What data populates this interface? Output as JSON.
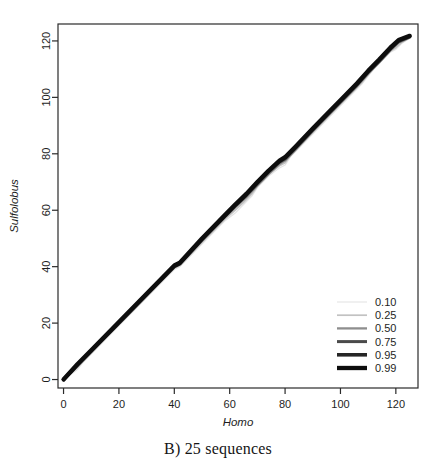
{
  "figure": {
    "caption": "B) 25 sequences",
    "panel_letter": "B)"
  },
  "axes": {
    "x": {
      "title": "Homo",
      "ticks": [
        "0",
        "20",
        "40",
        "60",
        "80",
        "100",
        "120"
      ]
    },
    "y": {
      "title": "Sulfolobus",
      "ticks": [
        "0",
        "20",
        "40",
        "60",
        "80",
        "100",
        "120"
      ]
    }
  },
  "legend": {
    "entries": [
      {
        "label": "0.10",
        "color": "#e3e3e3",
        "width": 1.1
      },
      {
        "label": "0.25",
        "color": "#c2c2c2",
        "width": 1.7
      },
      {
        "label": "0.50",
        "color": "#8e8e8e",
        "width": 2.3
      },
      {
        "label": "0.75",
        "color": "#4a4a4a",
        "width": 3.0
      },
      {
        "label": "0.95",
        "color": "#262626",
        "width": 3.6
      },
      {
        "label": "0.99",
        "color": "#0d0d0d",
        "width": 4.3
      }
    ]
  },
  "chart_data": {
    "type": "line",
    "title": "B) 25 sequences",
    "xlabel": "Homo",
    "ylabel": "Sulfolobus",
    "xlim": [
      -2,
      128
    ],
    "ylim": [
      -3,
      126
    ],
    "xticks": [
      0,
      20,
      40,
      60,
      80,
      100,
      120
    ],
    "yticks": [
      0,
      20,
      40,
      60,
      80,
      100,
      120
    ],
    "grid": false,
    "legend_position": "bottom-right",
    "legend_title": "",
    "series": [
      {
        "name": "0.10",
        "color": "#e3e3e3",
        "width": 1.1,
        "x": [
          0,
          3,
          5,
          7,
          10,
          20,
          30,
          40,
          42,
          50,
          58,
          62,
          65,
          68,
          70,
          74,
          78,
          80,
          82,
          90,
          96,
          100,
          104,
          108,
          112,
          115,
          118,
          120,
          122,
          125
        ],
        "y": [
          0,
          2,
          3.5,
          6,
          9,
          19,
          29,
          39,
          40,
          48,
          56,
          59,
          62,
          65,
          68,
          72,
          75,
          76,
          79,
          87,
          93,
          97,
          101,
          105,
          110,
          113,
          116,
          117,
          119,
          121
        ]
      },
      {
        "name": "0.25",
        "color": "#c2c2c2",
        "width": 1.7,
        "x": [
          0,
          3,
          5,
          7,
          10,
          20,
          30,
          40,
          42,
          50,
          58,
          62,
          65,
          68,
          70,
          74,
          78,
          80,
          82,
          90,
          96,
          100,
          104,
          108,
          112,
          115,
          118,
          120,
          122,
          125
        ],
        "y": [
          0,
          2.4,
          4.2,
          6.4,
          9.4,
          19.4,
          29.4,
          39.4,
          40.4,
          48.6,
          56.6,
          60,
          62.8,
          65.8,
          68.6,
          72.6,
          75.8,
          76.8,
          79.6,
          87.6,
          93.6,
          97.6,
          101.6,
          105.6,
          110.4,
          113.4,
          116.4,
          117.6,
          119.4,
          121
        ]
      },
      {
        "name": "0.50",
        "color": "#8e8e8e",
        "width": 2.3,
        "x": [
          0,
          5,
          10,
          20,
          30,
          40,
          42,
          50,
          58,
          62,
          66,
          70,
          74,
          78,
          80,
          84,
          90,
          96,
          100,
          106,
          110,
          114,
          118,
          121,
          125
        ],
        "y": [
          0,
          4.8,
          9.8,
          19.8,
          29.8,
          39.8,
          40.8,
          49.2,
          57.2,
          61,
          64.6,
          68.8,
          72.8,
          76.4,
          77.6,
          81.6,
          88,
          94,
          98,
          104,
          108.4,
          112.4,
          116.6,
          119.4,
          121.2
        ]
      },
      {
        "name": "0.75",
        "color": "#4a4a4a",
        "width": 3.0,
        "x": [
          0,
          5,
          10,
          20,
          30,
          40,
          42,
          50,
          58,
          62,
          66,
          70,
          74,
          78,
          80,
          84,
          90,
          96,
          100,
          106,
          110,
          114,
          118,
          121,
          125
        ],
        "y": [
          0,
          5,
          10,
          20,
          30,
          40,
          41,
          49.5,
          57.5,
          61.5,
          65.2,
          69.4,
          73.4,
          77,
          78.2,
          82.2,
          88.4,
          94.4,
          98.4,
          104.4,
          108.8,
          112.8,
          117,
          119.8,
          121.4
        ]
      },
      {
        "name": "0.95",
        "color": "#262626",
        "width": 3.6,
        "x": [
          0,
          5,
          10,
          20,
          30,
          40,
          42,
          50,
          58,
          62,
          66,
          70,
          74,
          78,
          80,
          84,
          90,
          96,
          100,
          106,
          110,
          114,
          118,
          121,
          125
        ],
        "y": [
          0,
          5.2,
          10.2,
          20.2,
          30.2,
          40.2,
          41.2,
          49.8,
          57.8,
          61.8,
          65.6,
          69.8,
          73.8,
          77.4,
          78.6,
          82.6,
          88.8,
          94.8,
          98.8,
          104.8,
          109.2,
          113.2,
          117.4,
          120.1,
          121.6
        ]
      },
      {
        "name": "0.99",
        "color": "#0d0d0d",
        "width": 4.3,
        "x": [
          0,
          5,
          10,
          20,
          30,
          40,
          42,
          50,
          58,
          62,
          66,
          70,
          74,
          78,
          80,
          84,
          90,
          96,
          100,
          106,
          110,
          114,
          118,
          121,
          125
        ],
        "y": [
          0,
          5.4,
          10.4,
          20.4,
          30.4,
          40.4,
          41.4,
          50,
          58,
          62,
          65.8,
          70,
          74,
          77.6,
          78.8,
          82.8,
          89,
          95,
          99,
          105,
          109.4,
          113.4,
          117.6,
          120.3,
          121.8
        ]
      }
    ]
  }
}
